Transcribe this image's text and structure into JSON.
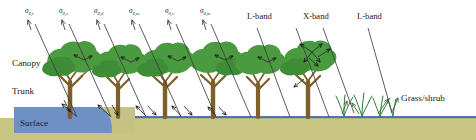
{
  "figure": {
    "name": "radar-scattering-vegetation-diagram",
    "type": "diagram",
    "width": 476,
    "height": 140,
    "background": "#ffffff"
  },
  "colors": {
    "canopy_green": "#4a9b3f",
    "canopy_green_dark": "#2f7a2a",
    "trunk_brown": "#8a6a2f",
    "trunk_brown_dark": "#6b4f22",
    "ground_khaki": "#c8c682",
    "water_blue": "#6f90c4",
    "water_blue_line": "#3b5ea8",
    "arrow_gray": "#4a4a4a",
    "text_dark": "#1a1a1a",
    "surface_label_text": "#15213f"
  },
  "scatter_labels": [
    {
      "id": "s0t",
      "symbol": "σ",
      "sub": "0,t",
      "x": 32,
      "y": 12
    },
    {
      "id": "s0s",
      "symbol": "σ",
      "sub": "0,s",
      "x": 66,
      "y": 12
    },
    {
      "id": "s0d",
      "symbol": "σ",
      "sub": "0,d",
      "x": 100,
      "y": 12
    },
    {
      "id": "s0m1",
      "symbol": "σ",
      "sub": "0,m",
      "x": 136,
      "y": 12
    },
    {
      "id": "s0c",
      "symbol": "σ",
      "sub": "0,c",
      "x": 172,
      "y": 12
    },
    {
      "id": "s0m2",
      "symbol": "σ",
      "sub": "0,m",
      "x": 207,
      "y": 12
    }
  ],
  "band_labels": [
    {
      "id": "lband-left",
      "text": "L-band",
      "x": 250,
      "y": 18
    },
    {
      "id": "xband",
      "text": "X-band",
      "x": 309,
      "y": 18
    },
    {
      "id": "lband-right",
      "text": "L-band",
      "x": 361,
      "y": 18
    }
  ],
  "layer_labels": [
    {
      "id": "canopy",
      "text": "Canopy",
      "x": 12,
      "y": 66
    },
    {
      "id": "trunk",
      "text": "Trunk",
      "x": 12,
      "y": 93
    },
    {
      "id": "surface",
      "text": "Surface",
      "x": 20,
      "y": 125
    }
  ],
  "feature_labels": [
    {
      "id": "grass-shrub",
      "text": "Grass/shrub",
      "x": 401,
      "y": 101
    }
  ],
  "surface_band": {
    "label": "Surface",
    "x": 14,
    "y": 107,
    "width": 121,
    "height": 26,
    "fill": "#6f90c4"
  },
  "ground": {
    "y": 118,
    "height": 22,
    "fill": "#c8c682",
    "waterline_y": 117,
    "waterline_fill": "#3b5ea8"
  },
  "trees": [
    {
      "id": "tree-1",
      "x": 70,
      "trunk_top": 72,
      "crown_r": 26,
      "band": "L"
    },
    {
      "id": "tree-2",
      "x": 118,
      "trunk_top": 74,
      "crown_r": 24,
      "band": "L"
    },
    {
      "id": "tree-3",
      "x": 165,
      "trunk_top": 74,
      "crown_r": 25,
      "band": "L"
    },
    {
      "id": "tree-4",
      "x": 213,
      "trunk_top": 73,
      "crown_r": 25,
      "band": "L"
    },
    {
      "id": "tree-5",
      "x": 258,
      "trunk_top": 74,
      "crown_r": 24,
      "band": "L"
    },
    {
      "id": "tree-6",
      "x": 308,
      "trunk_top": 72,
      "crown_r": 25,
      "band": "X"
    }
  ],
  "grass_tufts": [
    {
      "id": "tuft-1",
      "x": 344
    },
    {
      "id": "tuft-2",
      "x": 362
    },
    {
      "id": "tuft-3",
      "x": 380
    },
    {
      "id": "tuft-4",
      "x": 392
    }
  ],
  "incident_rays": [
    {
      "id": "ray-1",
      "x1": 77,
      "y1": 117,
      "x2": 35,
      "y2": 22
    },
    {
      "id": "ray-2",
      "x1": 111,
      "y1": 117,
      "x2": 69,
      "y2": 22
    },
    {
      "id": "ray-3",
      "x1": 146,
      "y1": 117,
      "x2": 104,
      "y2": 22
    },
    {
      "id": "ray-4",
      "x1": 181,
      "y1": 117,
      "x2": 139,
      "y2": 22
    },
    {
      "id": "ray-5",
      "x1": 216,
      "y1": 117,
      "x2": 175,
      "y2": 22
    },
    {
      "id": "ray-6",
      "x1": 251,
      "y1": 117,
      "x2": 210,
      "y2": 22
    },
    {
      "id": "ray-7",
      "x1": 288,
      "y1": 117,
      "x2": 256,
      "y2": 27
    },
    {
      "id": "ray-8",
      "x1": 327,
      "y1": 117,
      "x2": 296,
      "y2": 27
    },
    {
      "id": "ray-9",
      "x1": 352,
      "y1": 110,
      "x2": 322,
      "y2": 27
    },
    {
      "id": "ray-10",
      "x1": 390,
      "y1": 110,
      "x2": 366,
      "y2": 27
    }
  ]
}
